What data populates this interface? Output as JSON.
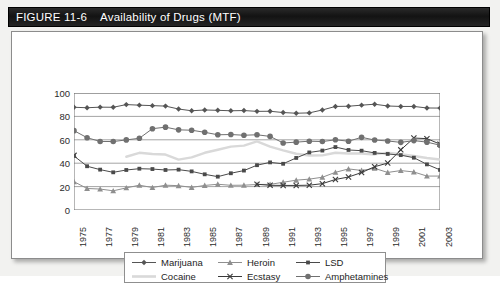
{
  "figure": {
    "number": "FIGURE 11-6",
    "title": "Availability of Drugs (MTF)"
  },
  "chart_data": {
    "type": "line",
    "title": "Availability of Drugs (MTF)",
    "xlabel": "",
    "ylabel": "",
    "ylim": [
      0,
      100
    ],
    "yticks": [
      0,
      20,
      40,
      60,
      80,
      100
    ],
    "grid": true,
    "legend_position": "bottom",
    "x": [
      1975,
      1976,
      1977,
      1978,
      1979,
      1980,
      1981,
      1982,
      1983,
      1984,
      1985,
      1986,
      1987,
      1988,
      1989,
      1990,
      1991,
      1992,
      1993,
      1994,
      1995,
      1996,
      1997,
      1998,
      1999,
      2000,
      2001,
      2002,
      2003
    ],
    "xtick_labels": [
      "1975",
      "1977",
      "1979",
      "1981",
      "1983",
      "1985",
      "1987",
      "1989",
      "1991",
      "1993",
      "1995",
      "1997",
      "1999",
      "2001",
      "2003"
    ],
    "series": [
      {
        "name": "Marijuana",
        "marker": "diamond",
        "color": "#555555",
        "values": [
          87.8,
          87.4,
          87.9,
          87.8,
          90.1,
          89.6,
          89.2,
          88.8,
          86.3,
          84.8,
          85.5,
          85.2,
          84.8,
          85.0,
          84.3,
          84.4,
          83.3,
          82.7,
          83.0,
          85.5,
          88.5,
          88.7,
          89.6,
          90.4,
          88.9,
          88.5,
          88.5,
          87.2,
          87.1
        ]
      },
      {
        "name": "Cocaine",
        "marker": "none",
        "color": "#d9d9d9",
        "values": [
          null,
          null,
          null,
          null,
          45.5,
          48.9,
          47.9,
          47.4,
          43.1,
          45.0,
          48.9,
          51.5,
          54.2,
          55.0,
          58.7,
          54.2,
          51.0,
          48.1,
          46.6,
          46.7,
          48.9,
          48.3,
          48.3,
          47.5,
          49.0,
          47.6,
          46.2,
          44.5,
          43.1
        ]
      },
      {
        "name": "Heroin",
        "marker": "triangle",
        "color": "#8f8f8f",
        "values": [
          24.2,
          18.4,
          17.9,
          16.4,
          18.9,
          21.2,
          19.2,
          21.2,
          20.8,
          19.3,
          21.0,
          22.0,
          21.1,
          21.2,
          21.8,
          21.9,
          23.7,
          25.5,
          26.4,
          28.0,
          32.2,
          35.1,
          33.8,
          35.6,
          32.1,
          33.7,
          32.5,
          29.0,
          29.0
        ]
      },
      {
        "name": "Ecstasy",
        "marker": "x",
        "color": "#3a3a3a",
        "values": [
          46.7,
          null,
          null,
          null,
          null,
          null,
          null,
          null,
          null,
          null,
          null,
          null,
          null,
          null,
          22.0,
          21.1,
          21.0,
          21.0,
          21.2,
          22.5,
          26.1,
          28.2,
          32.0,
          37.0,
          40.1,
          51.4,
          61.5,
          61.0,
          56.3
        ]
      },
      {
        "name": "LSD",
        "marker": "square",
        "color": "#4a4a4a",
        "values": [
          46.2,
          37.4,
          34.5,
          32.2,
          34.2,
          35.3,
          35.0,
          34.2,
          34.5,
          33.0,
          30.5,
          28.5,
          31.4,
          33.7,
          38.3,
          40.7,
          39.5,
          44.5,
          49.2,
          50.8,
          53.8,
          51.3,
          50.7,
          48.8,
          47.9,
          46.9,
          44.7,
          39.0,
          34.3
        ]
      },
      {
        "name": "Amphetamines",
        "marker": "circle",
        "color": "#707070",
        "values": [
          67.8,
          61.8,
          58.6,
          58.5,
          59.9,
          61.3,
          69.5,
          70.8,
          68.5,
          68.2,
          66.4,
          64.3,
          64.5,
          63.9,
          64.3,
          62.9,
          57.3,
          58.0,
          58.8,
          58.5,
          60.0,
          58.8,
          62.1,
          59.8,
          59.0,
          57.8,
          59.3,
          58.0,
          55.4
        ]
      }
    ]
  },
  "legend": {
    "items": [
      {
        "label": "Marijuana",
        "marker": "diamond",
        "color": "#555555"
      },
      {
        "label": "Cocaine",
        "marker": "none",
        "color": "#d9d9d9"
      },
      {
        "label": "Heroin",
        "marker": "triangle",
        "color": "#8f8f8f"
      },
      {
        "label": "Ecstasy",
        "marker": "x",
        "color": "#3a3a3a"
      },
      {
        "label": "LSD",
        "marker": "square",
        "color": "#4a4a4a"
      },
      {
        "label": "Amphetamines",
        "marker": "circle",
        "color": "#707070"
      }
    ]
  }
}
